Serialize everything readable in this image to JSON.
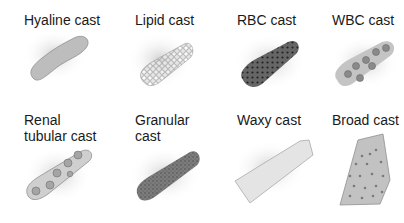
{
  "casts": [
    {
      "name": "Hyaline cast",
      "fill": "#bdbdbd",
      "row": 1,
      "col": 1
    },
    {
      "name": "Lipid cast",
      "fill": "#d8d8d8",
      "row": 1,
      "col": 2
    },
    {
      "name": "RBC cast",
      "fill": "#555555",
      "row": 1,
      "col": 3
    },
    {
      "name": "WBC cast",
      "fill": "#bfbfbf",
      "row": 1,
      "col": 4
    },
    {
      "name": "Renal\ntubular cast",
      "fill": "#c8c8c8",
      "row": 2,
      "col": 1
    },
    {
      "name": "Granular\ncast",
      "fill": "#7a7a7a",
      "row": 2,
      "col": 2
    },
    {
      "name": "Waxy cast",
      "fill": "#e6e6e6",
      "row": 2,
      "col": 3
    },
    {
      "name": "Broad cast",
      "fill": "#c2c2c2",
      "row": 2,
      "col": 4
    }
  ]
}
